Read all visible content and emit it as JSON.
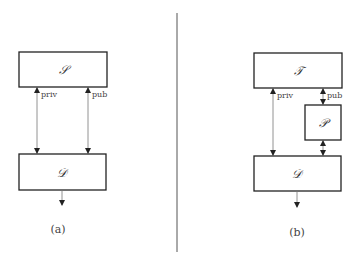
{
  "panel_a": {
    "caption": "(a)",
    "top_box": {
      "label": "𝒮"
    },
    "bottom_box": {
      "label": "𝒟"
    },
    "edges": [
      {
        "label": "priv",
        "from": "𝒮",
        "to": "𝒟",
        "bidirectional": true
      },
      {
        "label": "pub",
        "from": "𝒮",
        "to": "𝒟",
        "bidirectional": true
      }
    ],
    "output_arrow": true
  },
  "panel_b": {
    "caption": "(b)",
    "top_box": {
      "label": "𝒯"
    },
    "middle_box": {
      "label": "𝒫"
    },
    "bottom_box": {
      "label": "𝒟"
    },
    "edges": [
      {
        "label": "priv",
        "from": "𝒯",
        "to": "𝒟",
        "bidirectional": true
      },
      {
        "label": "pub",
        "from": "𝒯",
        "to": "𝒫",
        "bidirectional": true
      },
      {
        "label": "",
        "from": "𝒫",
        "to": "𝒟",
        "bidirectional": true
      }
    ],
    "output_arrow": true
  }
}
